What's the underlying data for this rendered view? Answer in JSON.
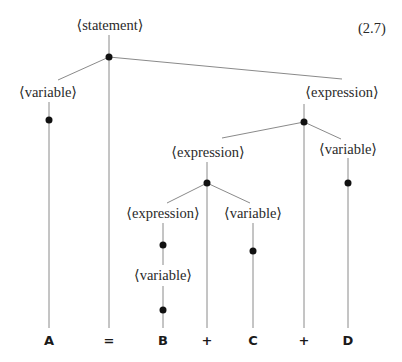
{
  "equation_number": "(2.7)",
  "nodes": {
    "statement": "⟨statement⟩",
    "variable_a": "⟨variable⟩",
    "expression_top": "⟨expression⟩",
    "expression_mid": "⟨expression⟩",
    "variable_d": "⟨variable⟩",
    "expression_low": "⟨expression⟩",
    "variable_c": "⟨variable⟩",
    "variable_b": "⟨variable⟩"
  },
  "terminals": [
    "A",
    "=",
    "B",
    "+",
    "C",
    "+",
    "D"
  ],
  "colors": {
    "line": "#8a8a8a",
    "dot": "#111111",
    "text": "#2a2a2a"
  }
}
